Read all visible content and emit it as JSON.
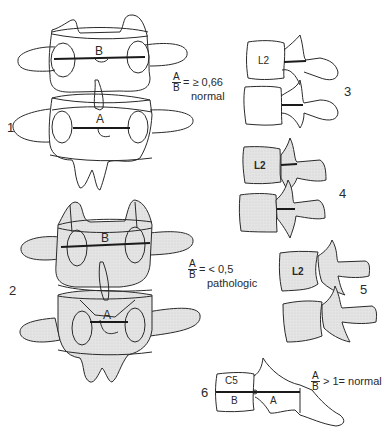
{
  "figure": {
    "panels": [
      {
        "id": "1",
        "label": "1",
        "upper_label": "B",
        "lower_label": "A",
        "fill": "none"
      },
      {
        "id": "2",
        "label": "2",
        "upper_label": "B",
        "lower_label": "A",
        "fill": "stippled"
      },
      {
        "id": "3",
        "label": "3",
        "vertebra_label": "L2",
        "fill": "none"
      },
      {
        "id": "4",
        "label": "4",
        "vertebra_label": "L2",
        "fill": "stippled"
      },
      {
        "id": "5",
        "label": "5",
        "vertebra_label": "L2",
        "fill": "stippled"
      },
      {
        "id": "6",
        "label": "6",
        "vertebra_label": "C5",
        "b_label": "B",
        "a_label": "A"
      }
    ],
    "ratios": [
      {
        "numerator": "A",
        "denominator": "B",
        "relation": "= ≥ 0,66",
        "note": "normal"
      },
      {
        "numerator": "A",
        "denominator": "B",
        "relation": "= < 0,5",
        "note": "pathologic"
      },
      {
        "numerator": "A",
        "denominator": "B",
        "relation": "> 1= normal",
        "note": ""
      }
    ],
    "colors": {
      "line": "#2a2a2a",
      "fill": "#e6e6e6",
      "background": "#ffffff"
    }
  }
}
